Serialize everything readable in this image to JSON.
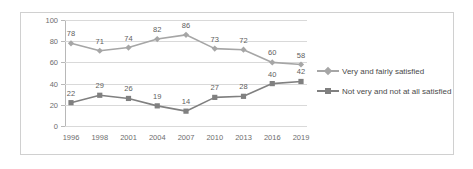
{
  "chart_data": {
    "type": "line",
    "title": "",
    "subtitle": "",
    "xlabel": "",
    "ylabel": "",
    "categories": [
      "1996",
      "1998",
      "2001",
      "2004",
      "2007",
      "2010",
      "2013",
      "2016",
      "2019"
    ],
    "series": [
      {
        "name": "Very and fairly satisfied",
        "values": [
          78,
          71,
          74,
          82,
          86,
          73,
          72,
          60,
          58
        ],
        "color": "#a6a6a6",
        "marker": "diamond"
      },
      {
        "name": "Not very and not at all satisfied",
        "values": [
          22,
          29,
          26,
          19,
          14,
          27,
          28,
          40,
          42
        ],
        "color": "#808080",
        "marker": "square"
      }
    ],
    "ylim": [
      0,
      100
    ],
    "yticks": [
      "0",
      "20",
      "40",
      "60",
      "80",
      "100"
    ],
    "grid": true,
    "data_labels": true,
    "legend_position": "right"
  },
  "colors": {
    "series1": "#a6a6a6",
    "series2": "#808080",
    "gridline": "#d9d9d9",
    "axis": "#b8b8b8",
    "frame_border": "#d0d0d0",
    "tick_text": "#6d6d6d",
    "label_text": "#5e5e5e",
    "legend_text": "#4a4a4a",
    "background": "#ffffff"
  }
}
